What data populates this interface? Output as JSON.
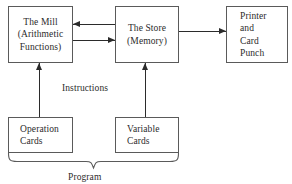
{
  "diagram": {
    "title_nodes": {
      "mill": {
        "lines": [
          "The Mill",
          "(Arithmetic",
          "Functions)"
        ]
      },
      "store": {
        "lines": [
          "The Store",
          "(Memory)"
        ]
      },
      "printer": {
        "lines": [
          "Printer",
          "and",
          "Card",
          "Punch"
        ]
      },
      "operation_cards": {
        "lines": [
          "Operation",
          "Cards"
        ]
      },
      "variable_cards": {
        "lines": [
          "Variable",
          "Cards"
        ]
      }
    },
    "labels": {
      "instructions": "Instructions",
      "program": "Program"
    },
    "colors": {
      "background": "#ffffff",
      "box_border": "#5a5a5a",
      "arrow": "#2b2b2b",
      "text": "#2b2b2b",
      "brace": "#5a5a5a"
    },
    "connections": [
      {
        "name": "store-to-mill",
        "direction": "left"
      },
      {
        "name": "mill-to-store",
        "direction": "right"
      },
      {
        "name": "store-to-printer",
        "direction": "right"
      },
      {
        "name": "operation-cards-to-mill",
        "direction": "up"
      },
      {
        "name": "variable-cards-to-store",
        "direction": "up"
      }
    ]
  }
}
